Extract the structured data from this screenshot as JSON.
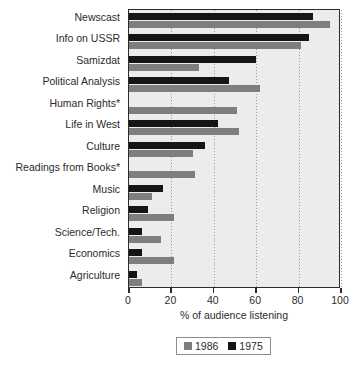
{
  "chart_data": {
    "type": "bar",
    "orientation": "horizontal",
    "title": "",
    "xlabel": "% of audience listening",
    "ylabel": "",
    "xlim": [
      0,
      100
    ],
    "xticks": [
      0,
      20,
      40,
      60,
      80,
      100
    ],
    "xticklabels": [
      "0",
      "20",
      "40",
      "60",
      "80",
      "100"
    ],
    "grid": true,
    "grid_axis": "x",
    "legend_position": "bottom",
    "categories": [
      "Newscast",
      "Info on USSR",
      "Samizdat",
      "Political Analysis",
      "Human Rights*",
      "Life in West",
      "Culture",
      "Readings from Books*",
      "Music",
      "Religion",
      "Science/Tech.",
      "Economics",
      "Agriculture"
    ],
    "series": [
      {
        "name": "1975",
        "color": "#151515",
        "values": [
          87,
          85,
          60,
          47,
          null,
          42,
          36,
          null,
          16,
          9,
          6,
          6,
          4
        ]
      },
      {
        "name": "1986",
        "color": "#7e7e7e",
        "values": [
          95,
          81,
          33,
          62,
          51,
          52,
          30,
          31,
          11,
          21,
          15,
          21,
          6
        ]
      }
    ]
  },
  "legend": {
    "entries": [
      {
        "label": "1986",
        "swatch": "gray-swatch"
      },
      {
        "label": "1975",
        "swatch": "black-swatch"
      }
    ]
  },
  "colors": {
    "series_1975": "#151515",
    "series_1986": "#7e7e7e",
    "plot_background": "#ececec",
    "frame": "#2b2b2b",
    "page_background": "#ffffff"
  }
}
